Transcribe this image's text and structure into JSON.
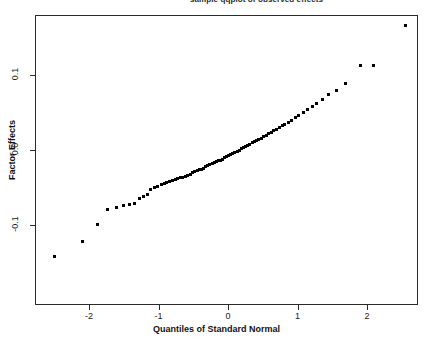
{
  "figure": {
    "title_fragment": "sample qqplot of observed effects",
    "background": "#ffffff",
    "frame_color": "#2a2a2a",
    "point_color": "#000000"
  },
  "axes": {
    "x_title": "Quantiles of Standard Normal",
    "y_title": "Factor Effects",
    "x_ticks": [
      "-2",
      "-1",
      "0",
      "1",
      "2"
    ],
    "y_ticks": [
      "0.1",
      "0.0",
      "-0.1"
    ]
  },
  "chart_data": {
    "type": "scatter",
    "title": "",
    "xlabel": "Quantiles of Standard Normal",
    "ylabel": "Factor Effects",
    "xlim": [
      -2.76,
      2.71
    ],
    "ylim": [
      -0.153,
      0.193
    ],
    "grid": false,
    "legend": "none",
    "marker": "filled-square",
    "x": [
      -2.5,
      -2.1,
      -1.88,
      -1.73,
      -1.6,
      -1.5,
      -1.42,
      -1.35,
      -1.28,
      -1.22,
      -1.16,
      -1.11,
      -1.06,
      -1.01,
      -0.96,
      -0.92,
      -0.88,
      -0.84,
      -0.8,
      -0.76,
      -0.72,
      -0.68,
      -0.65,
      -0.61,
      -0.58,
      -0.54,
      -0.51,
      -0.48,
      -0.44,
      -0.41,
      -0.38,
      -0.35,
      -0.32,
      -0.29,
      -0.26,
      -0.23,
      -0.2,
      -0.17,
      -0.14,
      -0.11,
      -0.08,
      -0.05,
      -0.02,
      0.01,
      0.04,
      0.07,
      0.1,
      0.13,
      0.16,
      0.19,
      0.22,
      0.25,
      0.28,
      0.31,
      0.35,
      0.38,
      0.41,
      0.44,
      0.48,
      0.51,
      0.55,
      0.58,
      0.62,
      0.66,
      0.7,
      0.74,
      0.78,
      0.82,
      0.87,
      0.92,
      0.97,
      1.02,
      1.08,
      1.14,
      1.21,
      1.28,
      1.36,
      1.45,
      1.56,
      1.69,
      1.9,
      2.1,
      2.55
    ],
    "y": [
      -0.142,
      -0.122,
      -0.099,
      -0.079,
      -0.076,
      -0.074,
      -0.073,
      -0.071,
      -0.064,
      -0.0615,
      -0.059,
      -0.052,
      -0.0505,
      -0.049,
      -0.0465,
      -0.045,
      -0.0435,
      -0.042,
      -0.0405,
      -0.0395,
      -0.0385,
      -0.037,
      -0.036,
      -0.035,
      -0.034,
      -0.032,
      -0.0305,
      -0.0285,
      -0.0275,
      -0.0265,
      -0.0255,
      -0.0245,
      -0.0215,
      -0.02,
      -0.019,
      -0.018,
      -0.017,
      -0.0155,
      -0.0145,
      -0.0135,
      -0.012,
      -0.0105,
      -0.009,
      -0.0075,
      -0.006,
      -0.0045,
      -0.003,
      -0.0015,
      0.0,
      0.0015,
      0.003,
      0.0045,
      0.006,
      0.008,
      0.0095,
      0.011,
      0.0125,
      0.014,
      0.016,
      0.018,
      0.0195,
      0.0215,
      0.0235,
      0.0255,
      0.028,
      0.0305,
      0.033,
      0.0345,
      0.037,
      0.04,
      0.043,
      0.0465,
      0.05,
      0.054,
      0.058,
      0.0625,
      0.0675,
      0.074,
      0.08,
      0.089,
      0.113,
      0.113,
      0.166
    ]
  }
}
